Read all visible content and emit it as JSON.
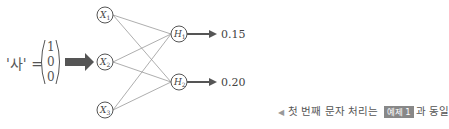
{
  "input": {
    "label": "'사' =",
    "vector": [
      "1",
      "0",
      "0"
    ]
  },
  "input_nodes": [
    {
      "id": "X1",
      "label": "X",
      "sub": "1"
    },
    {
      "id": "X2",
      "label": "X",
      "sub": "2"
    },
    {
      "id": "X3",
      "label": "X",
      "sub": "3"
    }
  ],
  "hidden_nodes": [
    {
      "id": "H1",
      "label": "H",
      "sub": "1",
      "output": "0.15"
    },
    {
      "id": "H2",
      "label": "H",
      "sub": "2",
      "output": "0.20"
    }
  ],
  "note": {
    "prefix": "첫 번째 문자 처리는",
    "badge": "예제 1",
    "suffix": "과 동일"
  },
  "colors": {
    "line": "#888888",
    "arrow": "#555555",
    "badge": "#888888"
  }
}
